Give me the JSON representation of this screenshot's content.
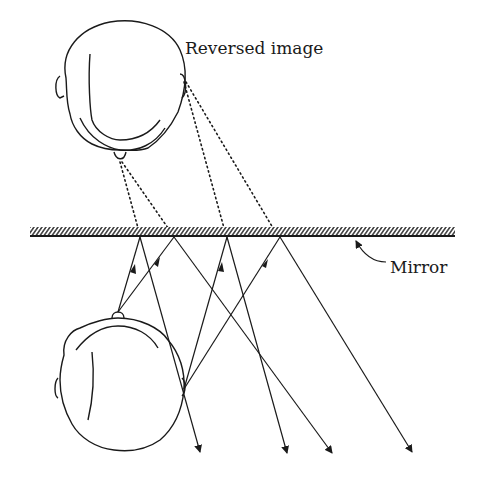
{
  "diagram": {
    "labels": {
      "reversed_image": "Reversed image",
      "mirror": "Mirror"
    },
    "colors": {
      "ink": "#1a1a1a",
      "background": "#ffffff"
    },
    "mirror": {
      "x1": 30,
      "x2": 455,
      "y_top": 227,
      "y_bottom": 237
    },
    "reflection_points": [
      {
        "x": 140,
        "y": 237
      },
      {
        "x": 174,
        "y": 237
      },
      {
        "x": 227,
        "y": 237
      },
      {
        "x": 280,
        "y": 237
      }
    ],
    "real_head": {
      "nose": {
        "x": 118,
        "y": 312
      },
      "ear": {
        "x": 184,
        "y": 389
      }
    },
    "virtual_head": {
      "nose": {
        "x": 120,
        "y": 162
      },
      "ear": {
        "x": 184,
        "y": 82
      }
    },
    "ray_ends": [
      {
        "x": 200,
        "y": 452
      },
      {
        "x": 332,
        "y": 453
      },
      {
        "x": 287,
        "y": 453
      },
      {
        "x": 412,
        "y": 452
      }
    ]
  }
}
